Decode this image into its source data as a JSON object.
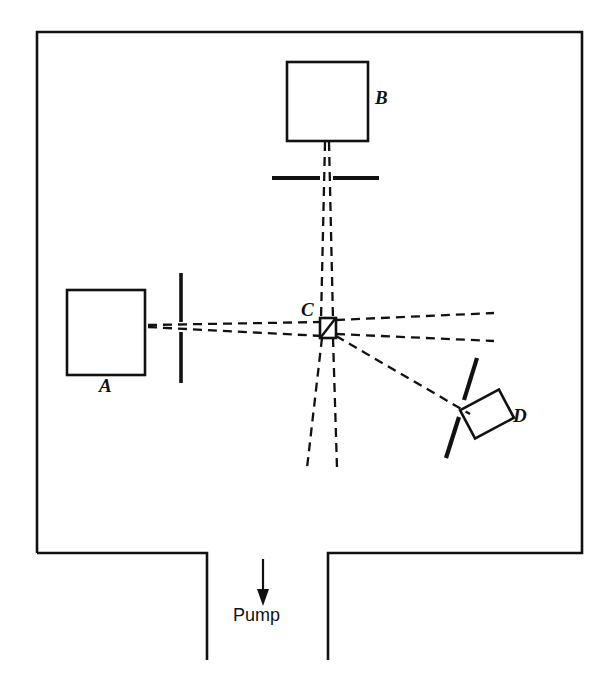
{
  "figure": {
    "type": "schematic-diagram",
    "background_color": "#ffffff",
    "line_color": "#111111",
    "components": [
      {
        "id": "A",
        "label": "A",
        "kind": "source-oven-box",
        "label_position": "below-box",
        "shape": "rectangle",
        "x": 67,
        "y": 290,
        "width": 78,
        "height": 85
      },
      {
        "id": "B",
        "label": "B",
        "kind": "source-oven-box",
        "label_position": "right-of-box",
        "shape": "rectangle",
        "x": 287,
        "y": 62,
        "width": 81,
        "height": 79
      },
      {
        "id": "C",
        "label": "C",
        "kind": "hatched-collision-region",
        "label_position": "upper-left-of-box",
        "shape": "small-hatched-square",
        "x": 320,
        "y": 318,
        "width": 16,
        "height": 20
      },
      {
        "id": "D",
        "label": "D",
        "kind": "rotated-detector-box",
        "label_position": "right-of-box",
        "shape": "rotated-rectangle",
        "rotation_deg": -28
      }
    ],
    "slits": [
      {
        "id": "slit-a",
        "orientation": "vertical",
        "for": "A"
      },
      {
        "id": "slit-b",
        "orientation": "horizontal",
        "for": "B"
      },
      {
        "id": "slit-d",
        "orientation": "tilted",
        "for": "D"
      }
    ],
    "beams": [
      {
        "id": "beam-a-to-c",
        "style": "dashed",
        "from": "A",
        "to": "C"
      },
      {
        "id": "beam-b-to-c",
        "style": "dashed",
        "from": "B",
        "to": "C"
      },
      {
        "id": "beam-c-right",
        "style": "dashed",
        "from": "C",
        "to": "chamber-right-wall"
      },
      {
        "id": "beam-c-down",
        "style": "dashed",
        "from": "C",
        "to": "chamber-lower-region"
      },
      {
        "id": "beam-c-to-d",
        "style": "dashed",
        "from": "C",
        "to": "D"
      }
    ],
    "pump": {
      "label": "Pump",
      "arrow_direction": "down"
    },
    "labels": {
      "a": "A",
      "b": "B",
      "c": "C",
      "d": "D",
      "pump": "Pump"
    }
  }
}
